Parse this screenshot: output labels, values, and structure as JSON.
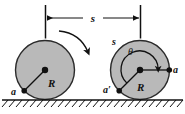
{
  "figure": {
    "type": "mechanics-diagram",
    "background_color": "#ffffff",
    "line_color": "#111111",
    "wheel_fill_color": "#b9b9b9",
    "wheel_stroke_color": "#2b2b2b",
    "marker_color": "#111111"
  },
  "dimension": {
    "label": "s",
    "description": "horizontal distance travelled between wheel centers"
  },
  "left_wheel": {
    "radius_label": "R",
    "contact_point_label": "a",
    "center_marker": "center-dot"
  },
  "rotation_arrow": {
    "name": "rolling-direction-arrow",
    "direction": "clockwise"
  },
  "right_wheel": {
    "arc_label": "s",
    "angle_label": "θ",
    "radius_label": "R",
    "contact_point_label": "a′",
    "rim_point_label": "a",
    "center_marker": "center-dot"
  },
  "ground": {
    "name": "hatched-ground-line"
  }
}
